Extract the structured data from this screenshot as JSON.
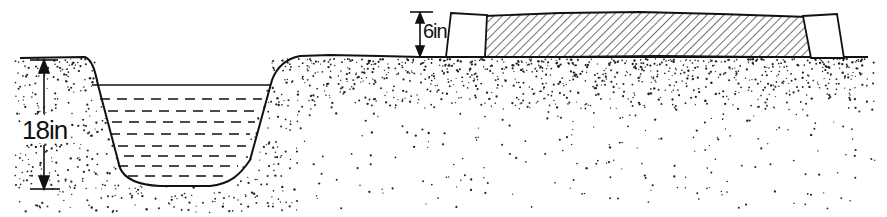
{
  "diagram": {
    "type": "cross-section",
    "labels": {
      "trench_depth": "18in",
      "bed_height": "6in"
    },
    "elements": [
      {
        "name": "soil-ground",
        "description": "stippled soil with ground line"
      },
      {
        "name": "trench",
        "description": "water-filled trench with sloped sides, depth 18in"
      },
      {
        "name": "raised-bed",
        "description": "hatched raised bed between two end blocks, height 6in"
      }
    ],
    "colors": {
      "ink": "#111111",
      "background": "#ffffff"
    }
  }
}
